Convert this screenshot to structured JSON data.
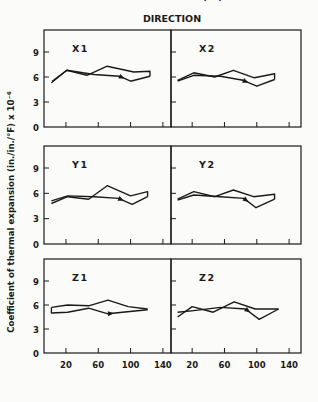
{
  "chart_data": {
    "type": "line",
    "title": "DIRECTION",
    "xlabel": "TEMPERATURE (°F)",
    "ylabel": "Coefficient of thermal expansion (in./in./°F) x 10⁻⁶",
    "xticks": [
      20,
      60,
      100,
      140
    ],
    "yticks": [
      0,
      3,
      6,
      9
    ],
    "xlim": [
      0,
      150
    ],
    "ylim": [
      0,
      11.6
    ],
    "grid": false,
    "layout": "3 rows x 2 columns small multiples",
    "panels": [
      {
        "name": "X1",
        "row": 0,
        "col": 0,
        "series": [
          {
            "name": "heating",
            "x": [
              2,
              21,
              46,
              71,
              104,
              124,
              124
            ],
            "y": [
              5.3,
              6.8,
              6.2,
              7.3,
              6.6,
              6.7,
              6.1
            ]
          },
          {
            "name": "cooling",
            "x": [
              124,
              100,
              86,
              55,
              21,
              3
            ],
            "y": [
              6.1,
              5.5,
              6.1,
              6.3,
              6.8,
              5.5
            ]
          }
        ]
      },
      {
        "name": "X2",
        "row": 0,
        "col": 1,
        "series": [
          {
            "name": "heating",
            "x": [
              2,
              22,
              48,
              71,
              97,
              122,
              122
            ],
            "y": [
              5.6,
              6.5,
              6.0,
              6.8,
              5.9,
              6.4,
              5.7
            ]
          },
          {
            "name": "cooling",
            "x": [
              122,
              100,
              83,
              55,
              22,
              2
            ],
            "y": [
              5.7,
              4.9,
              5.6,
              6.1,
              6.2,
              5.5
            ]
          }
        ]
      },
      {
        "name": "Y1",
        "row": 1,
        "col": 0,
        "series": [
          {
            "name": "heating",
            "x": [
              2,
              22,
              48,
              71,
              100,
              121,
              121
            ],
            "y": [
              4.8,
              5.6,
              5.3,
              6.9,
              5.7,
              6.2,
              5.6
            ]
          },
          {
            "name": "cooling",
            "x": [
              121,
              102,
              85,
              55,
              22,
              2
            ],
            "y": [
              5.6,
              4.7,
              5.4,
              5.6,
              5.7,
              5.1
            ]
          }
        ]
      },
      {
        "name": "Y2",
        "row": 1,
        "col": 1,
        "series": [
          {
            "name": "heating",
            "x": [
              2,
              22,
              48,
              71,
              96,
              122,
              122
            ],
            "y": [
              5.3,
              6.2,
              5.6,
              6.4,
              5.6,
              5.9,
              5.3
            ]
          },
          {
            "name": "cooling",
            "x": [
              122,
              99,
              84,
              55,
              22,
              2
            ],
            "y": [
              5.3,
              4.3,
              5.4,
              5.6,
              5.8,
              5.2
            ]
          }
        ]
      },
      {
        "name": "Z1",
        "row": 2,
        "col": 0,
        "series": [
          {
            "name": "heating",
            "x": [
              2,
              22,
              48,
              72,
              97,
              121
            ],
            "y": [
              5.7,
              6.0,
              5.9,
              6.6,
              5.8,
              5.5
            ]
          },
          {
            "name": "cooling",
            "x": [
              121,
              90,
              72,
              48,
              22,
              2,
              2
            ],
            "y": [
              5.4,
              5.1,
              4.9,
              5.6,
              5.1,
              5.0,
              5.7
            ]
          }
        ]
      },
      {
        "name": "Z2",
        "row": 2,
        "col": 1,
        "series": [
          {
            "name": "heating",
            "x": [
              2,
              20,
              46,
              72,
              98,
              127
            ],
            "y": [
              4.5,
              5.8,
              5.1,
              6.4,
              5.5,
              5.5
            ]
          },
          {
            "name": "cooling",
            "x": [
              127,
              103,
              86,
              55,
              22,
              2
            ],
            "y": [
              5.5,
              4.2,
              5.5,
              5.7,
              5.3,
              5.1
            ]
          }
        ]
      }
    ]
  }
}
